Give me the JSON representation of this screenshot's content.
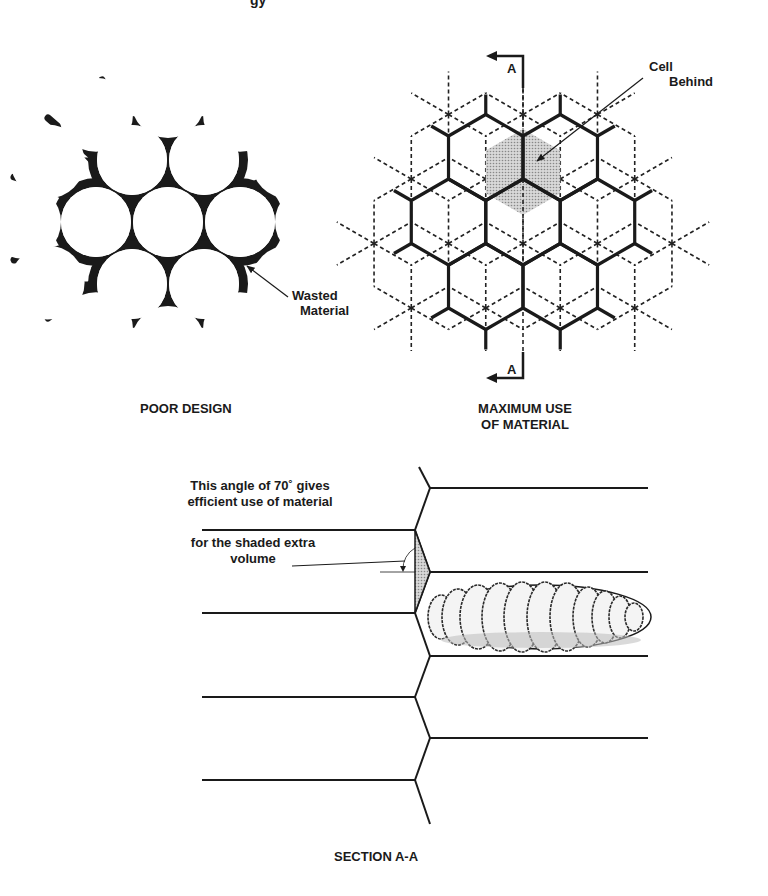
{
  "header_fragment": "gy",
  "poor_design": {
    "caption": "POOR DESIGN",
    "callout": [
      "Wasted",
      "Material"
    ]
  },
  "maximum_use": {
    "caption": [
      "MAXIMUM USE",
      "OF MATERIAL"
    ],
    "callout": [
      "Cell",
      "Behind"
    ],
    "section_marker": "A",
    "shade_color": "#bdbdbd"
  },
  "section": {
    "caption": "SECTION A-A",
    "note_lines": [
      "This angle of 70˚ gives",
      "efficient use of material"
    ],
    "note2_lines": [
      "for the shaded extra",
      "volume"
    ]
  }
}
